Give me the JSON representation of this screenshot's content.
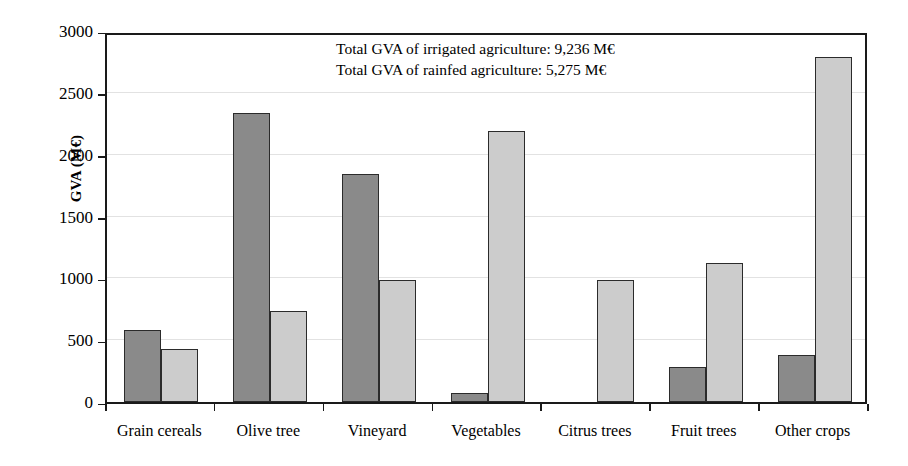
{
  "chart_data": {
    "type": "bar",
    "title": "",
    "xlabel": "",
    "ylabel": "GVA (M€)",
    "ylim": [
      0,
      3000
    ],
    "yticks": [
      0,
      500,
      1000,
      1500,
      2000,
      2500,
      3000
    ],
    "ytick_labels": [
      "0",
      "500",
      "1000",
      "1500",
      "2000",
      "2500",
      "3000"
    ],
    "grid": true,
    "legend": "none",
    "categories": [
      "Grain cereals",
      "Olive tree",
      "Vineyard",
      "Vegetables",
      "Citrus trees",
      "Fruit trees",
      "Other crops"
    ],
    "series": [
      {
        "name": "dark",
        "color": "#8a8a8a",
        "values": [
          585,
          2335,
          1840,
          70,
          0,
          280,
          380
        ]
      },
      {
        "name": "light",
        "color": "#cccccc",
        "values": [
          430,
          740,
          985,
          2190,
          990,
          1125,
          2790
        ]
      }
    ],
    "annotations": [
      "Total GVA of irrigated agriculture: 9,236 M€",
      "Total GVA of rainfed agriculture: 5,275 M€"
    ]
  },
  "axes": {
    "y_title": "GVA (M€)"
  }
}
